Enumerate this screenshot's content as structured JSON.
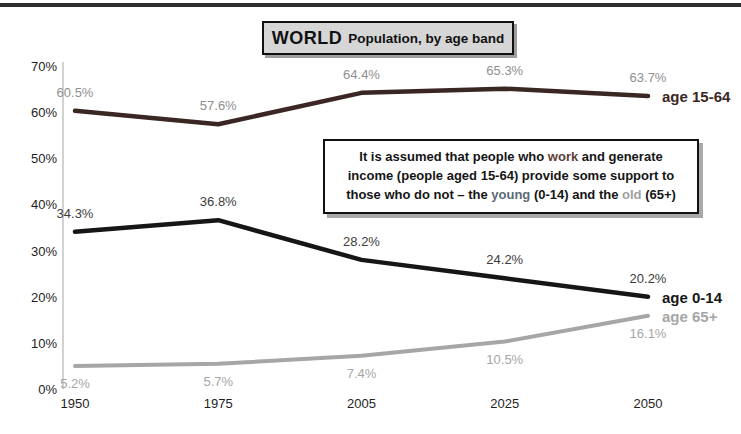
{
  "title": {
    "main": "WORLD",
    "sub": "Population, by age band"
  },
  "annotation": {
    "segments": [
      {
        "t": "It is assumed that people who "
      },
      {
        "t": "work",
        "c": "work"
      },
      {
        "t": " and generate income (people aged 15-64) provide some support to those who do not – the "
      },
      {
        "t": "young",
        "c": "young"
      },
      {
        "t": " (0-14) and the "
      },
      {
        "t": "old",
        "c": "old"
      },
      {
        "t": " (65+)"
      }
    ],
    "colors": {
      "work": "#5d4037",
      "young": "#5a6b78",
      "old": "#9e9e9e"
    }
  },
  "chart_data": {
    "type": "line",
    "title": "WORLD Population, by age band",
    "categories": [
      "1950",
      "1975",
      "2005",
      "2025",
      "2050"
    ],
    "series": [
      {
        "name": "age 15-64",
        "values": [
          60.5,
          57.6,
          64.4,
          65.3,
          63.7
        ],
        "color": "#3a2723",
        "label_color": "#8f8f8f",
        "label_position": "above",
        "stroke_width": 4.5
      },
      {
        "name": "age 0-14",
        "values": [
          34.3,
          36.8,
          28.2,
          24.2,
          20.2
        ],
        "color": "#161616",
        "label_color": "#3c3c3c",
        "label_position": "above",
        "stroke_width": 4.5
      },
      {
        "name": "age 65+",
        "values": [
          5.2,
          5.7,
          7.4,
          10.5,
          16.1
        ],
        "color": "#a6a6a6",
        "label_color": "#a6a6a6",
        "label_position": "below",
        "stroke_width": 4
      }
    ],
    "value_suffix": "%",
    "y_ticks": [
      "70%",
      "60%",
      "50%",
      "40%",
      "30%",
      "20%",
      "10%",
      "0%"
    ],
    "ylim": [
      0,
      70
    ],
    "grid": false,
    "legend_position": "line-end"
  }
}
